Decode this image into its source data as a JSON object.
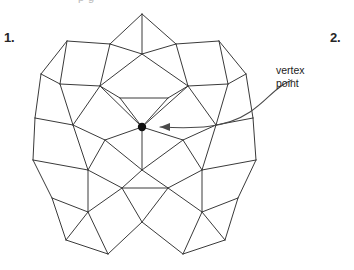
{
  "figure": {
    "title_clipped": "p  g",
    "item_numbers": [
      {
        "name": "item-1",
        "label": "1."
      },
      {
        "name": "item-2",
        "label": "2."
      }
    ],
    "callout": {
      "line1": "vertex",
      "line2": "point",
      "target_x": 142,
      "target_y": 127
    },
    "colors": {
      "edge": "#3a3a3a",
      "vertex_dot": "#111111",
      "arrow": "#4a4a4a",
      "text": "#1c1c1c",
      "background": "#ffffff"
    },
    "tiling": {
      "type": "snub-square-tiling",
      "vertex_configuration": "3.3.4.3.4",
      "shapes": [
        "square",
        "equilateral-triangle"
      ]
    },
    "geometry": {
      "edges": [
        [
          142,
          14,
          142,
          54
        ],
        [
          142,
          14,
          110,
          44
        ],
        [
          142,
          14,
          176,
          44
        ],
        [
          110,
          44,
          67,
          41
        ],
        [
          176,
          44,
          219,
          41
        ],
        [
          110,
          44,
          142,
          54
        ],
        [
          176,
          44,
          142,
          54
        ],
        [
          110,
          44,
          100,
          86
        ],
        [
          176,
          44,
          188,
          86
        ],
        [
          67,
          41,
          41,
          74
        ],
        [
          219,
          41,
          246,
          74
        ],
        [
          67,
          41,
          60,
          84
        ],
        [
          219,
          41,
          228,
          84
        ],
        [
          41,
          74,
          60,
          84
        ],
        [
          246,
          74,
          228,
          84
        ],
        [
          41,
          74,
          35,
          118
        ],
        [
          246,
          74,
          253,
          118
        ],
        [
          60,
          84,
          100,
          86
        ],
        [
          228,
          84,
          188,
          86
        ],
        [
          60,
          84,
          73,
          125
        ],
        [
          228,
          84,
          216,
          125
        ],
        [
          100,
          86,
          142,
          54
        ],
        [
          188,
          86,
          142,
          54
        ],
        [
          100,
          86,
          120,
          98
        ],
        [
          188,
          86,
          168,
          98
        ],
        [
          120,
          98,
          168,
          98
        ],
        [
          120,
          98,
          142,
          127
        ],
        [
          168,
          98,
          142,
          127
        ],
        [
          100,
          86,
          142,
          127
        ],
        [
          188,
          86,
          142,
          127
        ],
        [
          100,
          86,
          73,
          125
        ],
        [
          188,
          86,
          216,
          125
        ],
        [
          35,
          118,
          73,
          125
        ],
        [
          253,
          118,
          216,
          125
        ],
        [
          35,
          118,
          33,
          160
        ],
        [
          253,
          118,
          256,
          160
        ],
        [
          73,
          125,
          105,
          140
        ],
        [
          216,
          125,
          183,
          140
        ],
        [
          73,
          125,
          88,
          170
        ],
        [
          216,
          125,
          202,
          170
        ],
        [
          105,
          140,
          142,
          127
        ],
        [
          183,
          140,
          142,
          127
        ],
        [
          105,
          140,
          142,
          170
        ],
        [
          183,
          140,
          142,
          170
        ],
        [
          142,
          127,
          142,
          170
        ],
        [
          105,
          140,
          88,
          170
        ],
        [
          183,
          140,
          202,
          170
        ],
        [
          33,
          160,
          88,
          170
        ],
        [
          256,
          160,
          202,
          170
        ],
        [
          33,
          160,
          52,
          198
        ],
        [
          256,
          160,
          238,
          198
        ],
        [
          88,
          170,
          88,
          212
        ],
        [
          202,
          170,
          202,
          212
        ],
        [
          88,
          170,
          122,
          188
        ],
        [
          202,
          170,
          168,
          188
        ],
        [
          122,
          188,
          168,
          188
        ],
        [
          122,
          188,
          142,
          170
        ],
        [
          168,
          188,
          142,
          170
        ],
        [
          122,
          188,
          142,
          222
        ],
        [
          168,
          188,
          142,
          222
        ],
        [
          88,
          212,
          122,
          188
        ],
        [
          202,
          212,
          168,
          188
        ],
        [
          52,
          198,
          88,
          212
        ],
        [
          238,
          198,
          202,
          212
        ],
        [
          52,
          198,
          66,
          240
        ],
        [
          238,
          198,
          225,
          240
        ],
        [
          66,
          240,
          88,
          212
        ],
        [
          225,
          240,
          202,
          212
        ],
        [
          88,
          212,
          108,
          254
        ],
        [
          202,
          212,
          183,
          254
        ],
        [
          66,
          240,
          108,
          254
        ],
        [
          225,
          240,
          183,
          254
        ],
        [
          108,
          254,
          142,
          222
        ],
        [
          183,
          254,
          142,
          222
        ]
      ],
      "vertex_point_marker": {
        "cx": 142,
        "cy": 127,
        "r": 4.2
      },
      "arrow": {
        "path": "M 292,80 C 276,86 268,100 250,112 C 226,128 196,129 160,127",
        "head": "160,127 170,123 170,131"
      }
    }
  }
}
